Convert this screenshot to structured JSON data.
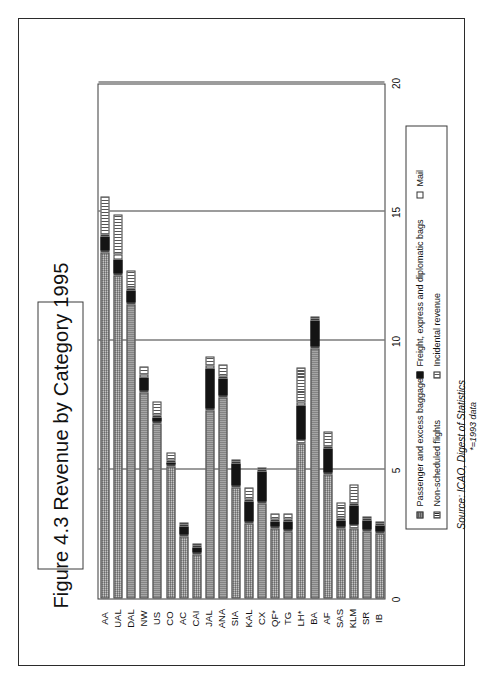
{
  "figure": {
    "title": "Figure 4.3  Revenue by Category 1995",
    "source_line": "Source: ICAO, Digest of Statistics",
    "source_note": "*=1993 data"
  },
  "axes": {
    "value_axis_label": "$ US",
    "value_axis_units": "Thousands",
    "tick_labels": [
      "0",
      "5",
      "10",
      "15",
      "20"
    ]
  },
  "legend": {
    "entries": [
      {
        "label": "Passenger and excess baggage",
        "key": "passenger",
        "swatch": "swatch-passenger"
      },
      {
        "label": "Non-scheduled flights",
        "key": "nonsched",
        "swatch": "swatch-nonscheduled"
      },
      {
        "label": "Freight, express and diplomatic bags",
        "key": "freight",
        "swatch": "swatch-freight"
      },
      {
        "label": "Mail",
        "key": "mail",
        "swatch": "swatch-mail"
      },
      {
        "label": "Incidental revenue",
        "key": "incidental",
        "swatch": "swatch-incidental"
      }
    ]
  },
  "chart_data": {
    "type": "bar",
    "orientation": "vertical",
    "stacked": true,
    "title": "Figure 4.3  Revenue by Category 1995",
    "xlabel": "",
    "ylabel": "$ US",
    "yunits": "Thousands",
    "ylim": [
      0,
      20
    ],
    "yticks": [
      0,
      5,
      10,
      15,
      20
    ],
    "grid": "value-axis gridlines at 5, 10, 15, 20",
    "legend_position": "below plot, boxed",
    "categories": [
      "AA",
      "UAL",
      "DAL",
      "NW",
      "US",
      "CO",
      "AC",
      "CAI",
      "JAL",
      "ANA",
      "SIA",
      "KAL",
      "CX",
      "QF*",
      "TG",
      "LH*",
      "BA",
      "AF",
      "SAS",
      "KLM",
      "SR",
      "IB"
    ],
    "series": [
      {
        "name": "Passenger and excess baggage",
        "values": [
          13.4,
          12.5,
          11.4,
          8.0,
          6.8,
          5.1,
          2.4,
          1.7,
          7.3,
          7.8,
          4.3,
          2.9,
          3.7,
          2.7,
          2.6,
          6.0,
          9.7,
          4.8,
          2.7,
          2.7,
          2.6,
          2.5
        ]
      },
      {
        "name": "Non-scheduled flights",
        "values": [
          0.05,
          0.05,
          0.05,
          0.05,
          0.05,
          0.05,
          0.05,
          0.05,
          0.05,
          0.05,
          0.05,
          0.05,
          0.05,
          0.05,
          0.05,
          0.15,
          0.05,
          0.05,
          0.05,
          0.15,
          0.05,
          0.05
        ]
      },
      {
        "name": "Freight, express and diplomatic bags",
        "values": [
          0.55,
          0.55,
          0.45,
          0.5,
          0.15,
          0.1,
          0.3,
          0.2,
          1.55,
          0.65,
          0.85,
          0.8,
          1.15,
          0.2,
          0.3,
          1.35,
          1.0,
          0.95,
          0.25,
          0.75,
          0.35,
          0.25
        ]
      },
      {
        "name": "Mail",
        "values": [
          0.1,
          0.2,
          0.1,
          0.1,
          0.05,
          0.05,
          0.05,
          0.05,
          0.1,
          0.05,
          0.05,
          0.05,
          0.05,
          0.05,
          0.05,
          0.1,
          0.05,
          0.05,
          0.05,
          0.05,
          0.05,
          0.05
        ]
      },
      {
        "name": "Incidental revenue",
        "values": [
          1.45,
          1.55,
          0.7,
          0.3,
          0.55,
          0.3,
          0.1,
          0.05,
          0.35,
          0.45,
          0.05,
          0.45,
          0.05,
          0.25,
          0.25,
          1.35,
          0.05,
          0.55,
          0.6,
          0.75,
          0.05,
          0.05
        ]
      }
    ],
    "totals": [
      15.55,
      14.85,
      12.7,
      8.95,
      7.6,
      5.6,
      2.9,
      2.05,
      9.35,
      8.95,
      5.3,
      4.25,
      5.0,
      3.25,
      3.2,
      8.95,
      10.85,
      6.4,
      3.65,
      4.4,
      3.1,
      2.9
    ]
  }
}
